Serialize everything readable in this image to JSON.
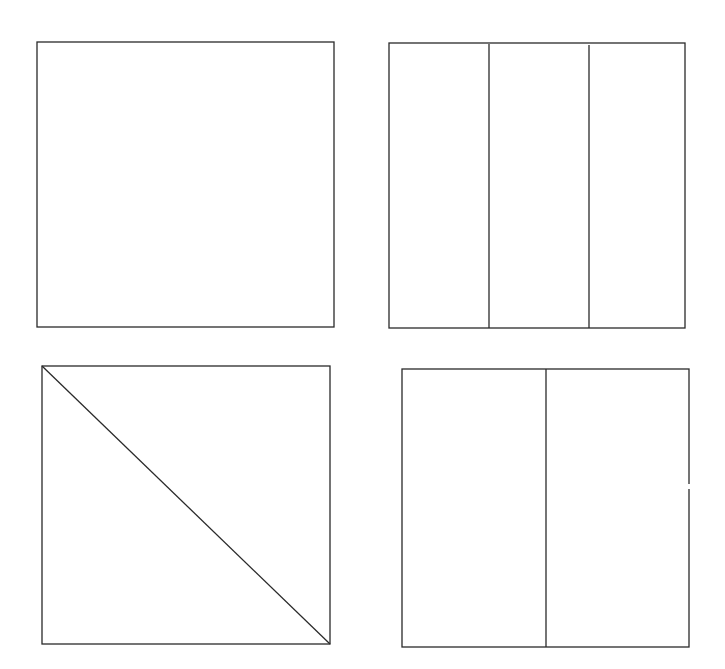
{
  "diagram": {
    "stroke_color": "#2a2a2a",
    "background": "#ffffff",
    "shapes": [
      {
        "id": "square-whole",
        "x": 37,
        "y": 42,
        "w": 297,
        "h": 285,
        "partition": "none",
        "parts": 1
      },
      {
        "id": "square-thirds",
        "x": 389,
        "y": 43,
        "w": 296,
        "h": 285,
        "partition": "vertical",
        "parts": 3,
        "dividers_x": [
          489,
          589
        ]
      },
      {
        "id": "square-diagonal-halves",
        "x": 42,
        "y": 366,
        "w": 288,
        "h": 278,
        "partition": "diagonal",
        "parts": 2
      },
      {
        "id": "square-vertical-halves",
        "x": 402,
        "y": 369,
        "w": 287,
        "h": 278,
        "partition": "vertical",
        "parts": 2,
        "dividers_x": [
          546
        ]
      }
    ]
  }
}
